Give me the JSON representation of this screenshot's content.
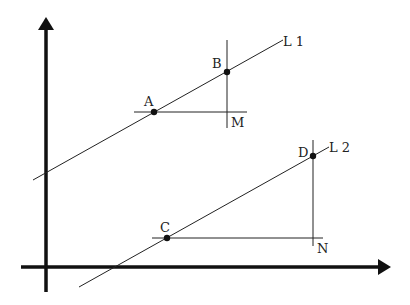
{
  "diagram": {
    "axes": {
      "x_axis": "horizontal axis with arrow",
      "y_axis": "vertical axis with arrow"
    },
    "lines": [
      {
        "label": "L1",
        "points": [
          "A",
          "B"
        ],
        "corner": "M"
      },
      {
        "label": "L2",
        "points": [
          "C",
          "D"
        ],
        "corner": "N"
      }
    ],
    "labels": {
      "L1": "L 1",
      "L2": "L 2",
      "A": "A",
      "B": "B",
      "M": "M",
      "C": "C",
      "D": "D",
      "N": "N"
    }
  }
}
